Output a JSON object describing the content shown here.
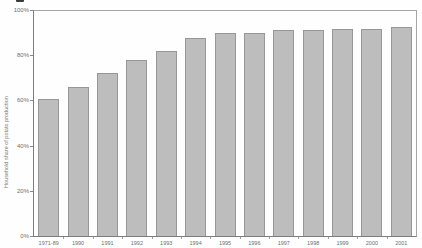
{
  "chart_data": {
    "type": "bar",
    "title": "",
    "xlabel": "",
    "ylabel": "Household share of potato production",
    "categories": [
      "1971-89",
      "1990",
      "1991",
      "1992",
      "1993",
      "1994",
      "1995",
      "1996",
      "1997",
      "1998",
      "1999",
      "2000",
      "2001"
    ],
    "values": [
      61,
      66,
      72.5,
      78,
      82,
      88,
      90,
      90,
      91.5,
      91.5,
      92,
      92,
      93
    ],
    "ylim": [
      0,
      100
    ],
    "yticks": [
      {
        "value": 0,
        "label": "0%"
      },
      {
        "value": 20,
        "label": "20%"
      },
      {
        "value": 40,
        "label": "40%"
      },
      {
        "value": 60,
        "label": "60%"
      },
      {
        "value": 80,
        "label": "80%"
      },
      {
        "value": 100,
        "label": "100%"
      }
    ],
    "grid": false,
    "legend": "none",
    "colors": {
      "bar_fill": "#bdbdbd",
      "bar_border": "#979797",
      "axis": "#7d7d7d",
      "frame": "#a6a6a6",
      "tick_text": "#6e6e6e",
      "background": "#fefefe"
    }
  }
}
